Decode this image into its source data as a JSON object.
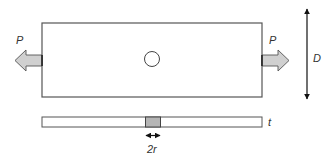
{
  "diagram": {
    "labels": {
      "load_left": "P",
      "load_right": "P",
      "width": "D",
      "thickness": "t",
      "hole_diameter": "2r"
    },
    "colors": {
      "outline": "#555555",
      "arrow_fill": "#d0d0d0",
      "hole_section_fill": "#b5b5b5",
      "dimension_line": "#111111",
      "text": "#333333"
    },
    "elements": [
      {
        "id": "plate-front-view",
        "shape": "rectangle",
        "x": 42,
        "y": 23,
        "w": 220,
        "h": 74
      },
      {
        "id": "hole",
        "shape": "circle",
        "cx": 152,
        "cy": 59,
        "r": 8
      },
      {
        "id": "load-arrow-left",
        "shape": "block-arrow",
        "direction": "left"
      },
      {
        "id": "load-arrow-right",
        "shape": "block-arrow",
        "direction": "right"
      },
      {
        "id": "width-dimension",
        "shape": "double-arrow",
        "orientation": "vertical"
      },
      {
        "id": "plate-side-view",
        "shape": "rectangle",
        "x": 42,
        "y": 117,
        "w": 220,
        "h": 10
      },
      {
        "id": "hole-section",
        "shape": "rectangle",
        "x": 145,
        "y": 117,
        "w": 15,
        "h": 10
      },
      {
        "id": "hole-dimension",
        "shape": "double-arrow",
        "orientation": "horizontal"
      }
    ]
  }
}
